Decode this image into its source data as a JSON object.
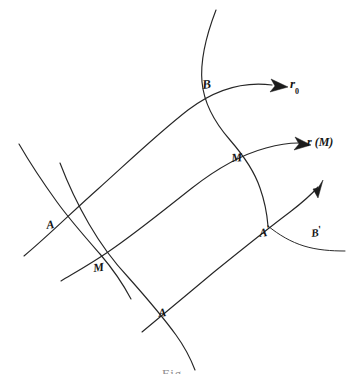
{
  "figure": {
    "kind": "hand-drawn-geometry-diagram",
    "background_color": "#ffffff",
    "ink_color": "#262626",
    "width": 354,
    "height": 374
  },
  "labels": {
    "b_top": "B",
    "gamma_zero": "r",
    "gamma_zero_subscript": "0",
    "m_upper": "M",
    "r_of_m": "r (M)",
    "a_left": "A",
    "m_lower": "M",
    "a_prime": "A",
    "a_prime_mark": "'",
    "a_bottom": "A",
    "b_prime": "B",
    "b_prime_mark": "'"
  },
  "caption": {
    "text": "Fig."
  },
  "curves": [
    {
      "name": "upper-band-curve",
      "role": "geodesic gamma-zero from A through B to arrow",
      "endpoints": [
        "A",
        "B"
      ]
    },
    {
      "name": "lower-band-curve",
      "role": "geodesic r(M) from lower M through upper M to arrow",
      "endpoints": [
        "M",
        "M"
      ]
    },
    {
      "name": "left-transversal-curve",
      "role": "transversal through A and lower M",
      "endpoints": [
        "top-left",
        "bottom-left"
      ]
    },
    {
      "name": "right-transversal-curve",
      "role": "transversal through B, upper M and A-prime",
      "endpoints": [
        "top",
        "bottom-right"
      ]
    },
    {
      "name": "second-left-transversal",
      "role": "transversal through lower M down to bottom A",
      "endpoints": [
        "upper-left",
        "bottom"
      ]
    },
    {
      "name": "bottom-right-curve",
      "role": "curve through bottom A and A-prime with arrow",
      "endpoints": [
        "bottom",
        "upper-right-arrow"
      ]
    },
    {
      "name": "b-prime-curve",
      "role": "short curve near B-prime at far right",
      "endpoints": [
        "right",
        "far-right"
      ]
    }
  ],
  "arrows": [
    {
      "name": "gamma-zero-arrow",
      "direction": "right",
      "target_label": "r0"
    },
    {
      "name": "r-of-m-arrow",
      "direction": "right",
      "target_label": "r(M)"
    },
    {
      "name": "bottom-right-arrow",
      "direction": "up-right",
      "target_label": ""
    }
  ]
}
